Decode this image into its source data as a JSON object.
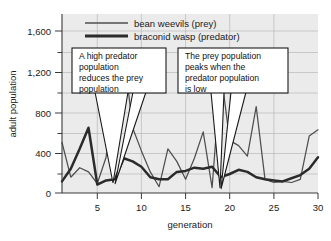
{
  "chart_data": {
    "type": "line",
    "title": "",
    "xlabel": "generation",
    "ylabel": "adult population",
    "xlim": [
      1,
      30
    ],
    "ylim": [
      0,
      1700
    ],
    "grid": true,
    "legend_position": "top-center",
    "y_ticks_major": [
      "0",
      "400",
      "800",
      "1,200",
      "1,600"
    ],
    "y_tick_values": [
      0,
      400,
      800,
      1200,
      1600
    ],
    "y_minor_tick_values": [
      200,
      600,
      1000,
      1400
    ],
    "x_ticks": [
      "5",
      "10",
      "15",
      "20",
      "25",
      "30"
    ],
    "x_tick_values": [
      5,
      10,
      15,
      20,
      25,
      30
    ],
    "x": [
      1,
      2,
      3,
      4,
      5,
      6,
      7,
      8,
      9,
      10,
      11,
      12,
      13,
      14,
      15,
      16,
      17,
      18,
      19,
      20,
      21,
      22,
      23,
      24,
      25,
      26,
      27,
      28,
      29,
      30
    ],
    "series": [
      {
        "name": "bean weevils (prey)",
        "role": "prey",
        "color": "#4f4f4f",
        "width": "thin",
        "values": [
          480,
          150,
          240,
          200,
          90,
          340,
          1080,
          1350,
          620,
          400,
          200,
          60,
          420,
          300,
          130,
          330,
          580,
          50,
          1150,
          500,
          450,
          350,
          820,
          130,
          100,
          110,
          100,
          130,
          540,
          600
        ]
      },
      {
        "name": "braconid wasp (predator)",
        "role": "predator",
        "color": "#2b2b2b",
        "width": "thick",
        "values": [
          110,
          230,
          420,
          620,
          80,
          120,
          130,
          330,
          300,
          250,
          150,
          130,
          130,
          200,
          210,
          240,
          230,
          250,
          150,
          180,
          220,
          200,
          150,
          130,
          120,
          110,
          140,
          170,
          230,
          340
        ]
      }
    ],
    "annotations": [
      {
        "id": "callout-predator",
        "text": "A high predator population reduces the prey population",
        "lines": [
          "A high predator",
          "population",
          "reduces the prey",
          "population"
        ],
        "points_to_x": 6
      },
      {
        "id": "callout-prey",
        "text": "The prey population peaks when the predator population is low",
        "lines": [
          "The prey population",
          "peaks when the",
          "predator population",
          "is low"
        ],
        "points_to_x": 19
      }
    ],
    "colors": {
      "plot_background": "#ebebeb",
      "gridline": "#b9b9b9",
      "axis": "#3a3a3a",
      "prey_line": "#4f4f4f",
      "predator_line": "#2b2b2b",
      "callout_border": "#1a1a1a",
      "callout_fill": "#ffffff",
      "page_background": "#ffffff"
    }
  }
}
